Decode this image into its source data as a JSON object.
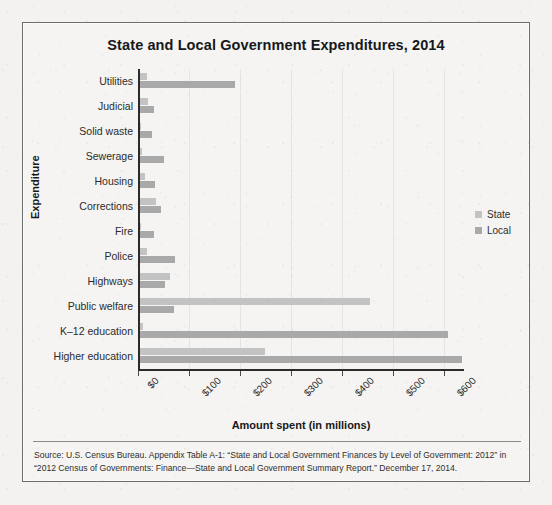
{
  "figure": {
    "title": "State and Local Government Expenditures, 2014",
    "source_note": "Source: U.S. Census Bureau. Appendix Table A-1: “State and Local Government Finances by Level of Government: 2012” in “2012 Census of Governments: Finance—State and Local Government Summary Report.” December 17, 2014.",
    "frame_color": "#6e6e6e",
    "paper_color": "#f3f2f0"
  },
  "legend": {
    "position": "right",
    "entries": [
      {
        "label": "State",
        "color": "#c3c3c3"
      },
      {
        "label": "Local",
        "color": "#a9a9a9"
      }
    ]
  },
  "chart_data": {
    "type": "bar",
    "orientation": "horizontal",
    "title": "State and Local Government Expenditures, 2014",
    "xlabel": "Amount spent (in millions)",
    "ylabel": "Expenditure",
    "xlim": [
      0,
      640
    ],
    "xticks": [
      0,
      100,
      200,
      300,
      400,
      500,
      600
    ],
    "xtick_labels": [
      "$0",
      "$100",
      "$200",
      "$300",
      "$400",
      "$500",
      "$600"
    ],
    "grid": true,
    "categories": [
      "Utilities",
      "Judicial",
      "Solid waste",
      "Sewerage",
      "Housing",
      "Corrections",
      "Fire",
      "Police",
      "Highways",
      "Public welfare",
      "K–12 education",
      "Higher education"
    ],
    "series": [
      {
        "name": "State",
        "color": "#c3c3c3",
        "values": [
          14,
          16,
          2,
          4,
          10,
          31,
          1,
          14,
          58,
          452,
          5,
          245
        ]
      },
      {
        "name": "Local",
        "color": "#a9a9a9",
        "values": [
          186,
          27,
          24,
          48,
          29,
          42,
          28,
          68,
          50,
          66,
          605,
          632
        ]
      }
    ]
  }
}
